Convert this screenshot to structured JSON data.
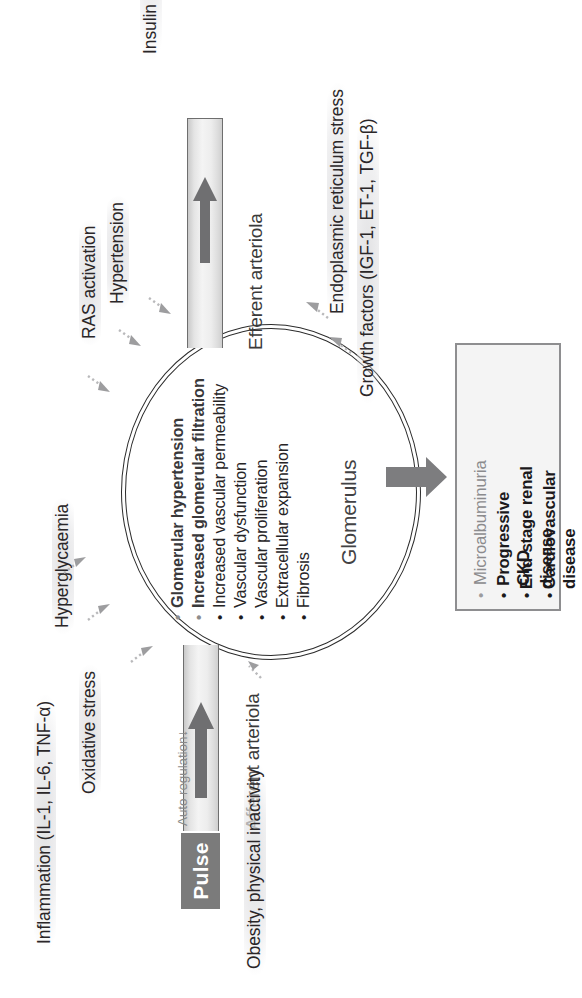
{
  "figure": {
    "orientation": "rotated-90-ccw",
    "colors": {
      "arrow_grey": "#7b7b7b",
      "vessel_grey": "#ededed",
      "box_border": "#8e8e90",
      "box_fill": "#f4f4f4",
      "text_dark": "#231f20",
      "text_muted": "#8b8b8d",
      "halo_grey": "#e4e4e6"
    }
  },
  "risk_factors": [
    {
      "label": "Insulin resistance/hyperinsulinemia"
    },
    {
      "label": "Hypertension"
    },
    {
      "label": "RAS activation"
    },
    {
      "label": "Hyperglycaemia"
    },
    {
      "label": "Oxidative stress"
    },
    {
      "label": "Inflammation (IL-1, IL-6, TNF-α)"
    },
    {
      "label": "Obesity, physical inactivity"
    },
    {
      "label": "Endoplasmic reticulum stress"
    },
    {
      "label": "Growth factors (IGF-1, ET-1, TGF-β)"
    }
  ],
  "vessels": {
    "efferent": {
      "label": "Efferent arteriola"
    },
    "afferent": {
      "label": "Afferent arteriola"
    },
    "auto_regulation": {
      "label": "Auto regulation↓"
    },
    "pulse": {
      "label": "Pulse"
    }
  },
  "glomerulus": {
    "name": "Glomerulus",
    "items": [
      {
        "text": "Glomerular hypertension",
        "emphasis": "strong"
      },
      {
        "text": "Increased glomerular filtration",
        "emphasis": "strong"
      },
      {
        "text": "Increased vascular permeability",
        "emphasis": "plain"
      },
      {
        "text": "Vascular dysfunction",
        "emphasis": "plain"
      },
      {
        "text": "Vascular proliferation",
        "emphasis": "plain"
      },
      {
        "text": "Extracellular expansion",
        "emphasis": "plain"
      },
      {
        "text": "Fibrosis",
        "emphasis": "plain"
      }
    ],
    "bullet": "•"
  },
  "outcomes": {
    "items": [
      {
        "text": "Microalbuminuria",
        "emphasis": "light"
      },
      {
        "text": "Progressive CKD",
        "emphasis": "bold"
      },
      {
        "text": "End-stage renal disease",
        "emphasis": "bold"
      },
      {
        "text": "Cardiovascular disease",
        "emphasis": "bold"
      }
    ],
    "bullet": "•"
  }
}
